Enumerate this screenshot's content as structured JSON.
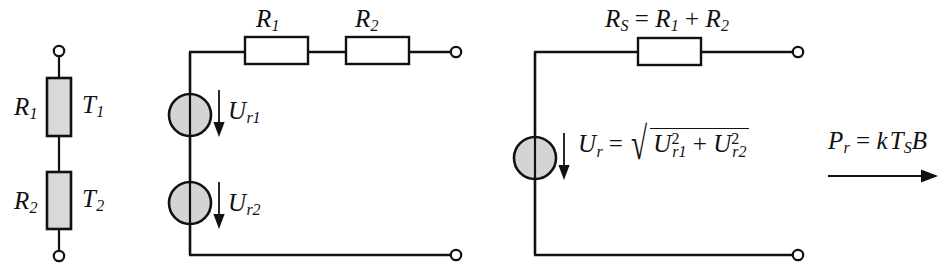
{
  "figure": {
    "type": "circuit-diagram",
    "stroke_color": "#111111",
    "resistor_fill_shaded": "#d9d9d9",
    "resistor_fill_plain": "#ffffff",
    "source_fill": "#d4d4d4",
    "background": "#ffffff"
  },
  "panels": {
    "left": {
      "name": "series-resistor-pair",
      "labels": {
        "r1": "R",
        "r1_sub": "1",
        "t1": "T",
        "t1_sub": "1",
        "r2": "R",
        "r2_sub": "2",
        "t2": "T",
        "t2_sub": "2"
      }
    },
    "middle": {
      "name": "two-noise-source-equivalent",
      "labels": {
        "r1": "R",
        "r1_sub": "1",
        "r2": "R",
        "r2_sub": "2",
        "ur1": "U",
        "ur1_sub": "r1",
        "ur2": "U",
        "ur2_sub": "r2"
      }
    },
    "right": {
      "name": "combined-noise-source-equivalent",
      "labels": {
        "rs": "R",
        "rs_sub": "S",
        "rs_eq": "=",
        "rs_r1": "R",
        "rs_r1_sub": "1",
        "rs_plus": "+",
        "rs_r2": "R",
        "rs_r2_sub": "2",
        "ur": "U",
        "ur_sub": "r",
        "ur_eq": "=",
        "rad_u1": "U",
        "rad_u1_sub": "r1",
        "rad_u1_sup": "2",
        "rad_plus": "+",
        "rad_u2": "U",
        "rad_u2_sub": "r2",
        "rad_u2_sup": "2"
      }
    },
    "output": {
      "name": "noise-power-output",
      "labels": {
        "pr": "P",
        "pr_sub": "r",
        "eq": "=",
        "k": "k",
        "t": "T",
        "t_sub": "S",
        "b": "B"
      }
    }
  }
}
